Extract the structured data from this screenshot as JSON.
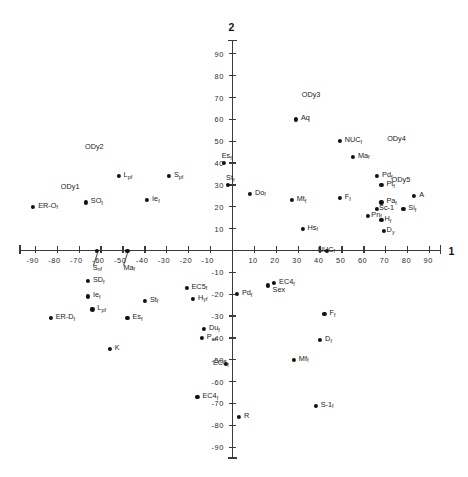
{
  "chart_data": {
    "type": "scatter",
    "title": "",
    "xlabel": "1",
    "ylabel": "2",
    "xlim": [
      -100,
      100
    ],
    "ylim": [
      -100,
      100
    ],
    "grid": false,
    "legend": null,
    "xticks": [
      -90,
      -80,
      -70,
      -60,
      -50,
      -40,
      -30,
      -20,
      -10,
      10,
      20,
      30,
      40,
      50,
      60,
      70,
      80,
      90
    ],
    "yticks": [
      -90,
      -80,
      -70,
      -60,
      -50,
      -40,
      -30,
      -20,
      -10,
      10,
      20,
      30,
      40,
      50,
      60,
      70,
      80,
      90
    ],
    "xticklabels": [
      "-90",
      "-80",
      "-70",
      "-60",
      "-50",
      "-40",
      "-30",
      "-20",
      "-10",
      "10",
      "20",
      "30",
      "40",
      "50",
      "60",
      "70",
      "80",
      "90"
    ],
    "yticklabels": [
      "-90",
      "-80",
      "-70",
      "-60",
      "-50",
      "-40",
      "-30",
      "-20",
      "-10",
      "10",
      "20",
      "30",
      "40",
      "50",
      "60",
      "70",
      "80",
      "90"
    ],
    "points": [
      {
        "label": "ODy2",
        "base": "ODy2",
        "sub": "",
        "x": -66,
        "y": 44,
        "marker": "none",
        "lx": -3,
        "ly": -9
      },
      {
        "label": "ODy1",
        "base": "ODy1",
        "sub": "",
        "x": -77,
        "y": 26,
        "marker": "none",
        "lx": -3,
        "ly": -9
      },
      {
        "label": "ODy3",
        "base": "ODy3",
        "sub": "",
        "x": 33,
        "y": 68,
        "marker": "none",
        "lx": -3,
        "ly": -9
      },
      {
        "label": "ODy4",
        "base": "ODy4",
        "sub": "",
        "x": 72,
        "y": 48,
        "marker": "none",
        "lx": -3,
        "ly": -9
      },
      {
        "label": "ODy5",
        "base": "ODy5",
        "sub": "",
        "x": 74,
        "y": 29,
        "marker": "none",
        "lx": -3,
        "ly": -9
      },
      {
        "label": "ERO",
        "base": "ER-O",
        "sub": "f",
        "x": -91,
        "y": 20,
        "marker": "dot",
        "lx": 5,
        "ly": -3
      },
      {
        "label": "SO",
        "base": "SO",
        "sub": "f",
        "x": -67,
        "y": 22,
        "marker": "dot",
        "lx": 5,
        "ly": -3
      },
      {
        "label": "Lp",
        "base": "L",
        "sub": "p f",
        "x": -52,
        "y": 34,
        "marker": "dot",
        "lx": 5,
        "ly": -3
      },
      {
        "label": "Ie",
        "base": "Ie",
        "sub": "f",
        "x": -39,
        "y": 23,
        "marker": "dot",
        "lx": 5,
        "ly": -3
      },
      {
        "label": "Sp",
        "base": "S",
        "sub": "p f",
        "x": -29,
        "y": 34,
        "marker": "dot",
        "lx": 5,
        "ly": -3
      },
      {
        "label": "Es",
        "base": "Es",
        "sub": "f",
        "x": -4,
        "y": 40,
        "marker": "dot",
        "lx": -2,
        "ly": -9
      },
      {
        "label": "St",
        "base": "St",
        "sub": "f",
        "x": -2,
        "y": 30,
        "marker": "dot",
        "lx": -2,
        "ly": -9
      },
      {
        "label": "Do",
        "base": "Do",
        "sub": "f",
        "x": 8,
        "y": 26,
        "marker": "dot",
        "lx": 5,
        "ly": -3
      },
      {
        "label": "Mt",
        "base": "Mt",
        "sub": "f",
        "x": 27,
        "y": 23,
        "marker": "dot",
        "lx": 5,
        "ly": -3
      },
      {
        "label": "Hs",
        "base": "Hs",
        "sub": "f",
        "x": 32,
        "y": 10,
        "marker": "dot",
        "lx": 5,
        "ly": -3
      },
      {
        "label": "Aq",
        "base": "Aq",
        "sub": "",
        "x": 29,
        "y": 60,
        "marker": "dot",
        "lx": 5,
        "ly": -3
      },
      {
        "label": "NUC",
        "base": "NUC",
        "sub": "f",
        "x": 49,
        "y": 50,
        "marker": "dot",
        "lx": 5,
        "ly": -3
      },
      {
        "label": "Ma",
        "base": "Ma",
        "sub": "f",
        "x": 55,
        "y": 43,
        "marker": "dot",
        "lx": 5,
        "ly": -3
      },
      {
        "label": "Pd",
        "base": "Pd",
        "sub": "f",
        "x": 66,
        "y": 34,
        "marker": "dot",
        "lx": 5,
        "ly": -3
      },
      {
        "label": "Pt",
        "base": "Pt",
        "sub": "f",
        "x": 68,
        "y": 30,
        "marker": "dot",
        "lx": 5,
        "ly": -3
      },
      {
        "label": "A",
        "base": "A",
        "sub": "",
        "x": 83,
        "y": 25,
        "marker": "dot",
        "lx": 5,
        "ly": -3
      },
      {
        "label": "F",
        "base": "F",
        "sub": "f",
        "x": 49,
        "y": 24,
        "marker": "dot",
        "lx": 5,
        "ly": -3
      },
      {
        "label": "Pa",
        "base": "Pa",
        "sub": "f",
        "x": 68,
        "y": 22,
        "marker": "dot",
        "lx": 5,
        "ly": -3
      },
      {
        "label": "Si",
        "base": "Si",
        "sub": "f",
        "x": 78,
        "y": 19,
        "marker": "dot",
        "lx": 5,
        "ly": -3
      },
      {
        "label": "Sc1",
        "base": "Sc-1",
        "sub": "",
        "x": 66,
        "y": 19,
        "marker": "dot",
        "lx": 2,
        "ly": -3
      },
      {
        "label": "Pn",
        "base": "Pn",
        "sub": "f",
        "x": 62,
        "y": 16,
        "marker": "dot",
        "lx": 3,
        "ly": -3
      },
      {
        "label": "Hf",
        "base": "H",
        "sub": "f",
        "x": 68,
        "y": 14,
        "marker": "dot",
        "lx": 3,
        "ly": -3
      },
      {
        "label": "Dy",
        "base": "D",
        "sub": "y",
        "x": 69,
        "y": 9,
        "marker": "dot",
        "lx": 3,
        "ly": -3
      },
      {
        "label": "Sn",
        "base": "S",
        "sub": "n f",
        "x": -62,
        "y": 0,
        "marker": "dot",
        "lx": -4,
        "ly": 15
      },
      {
        "label": "Ma0",
        "base": "Ma",
        "sub": "f",
        "x": -48,
        "y": 0,
        "marker": "dot",
        "lx": -4,
        "ly": 15
      },
      {
        "label": "NUC0",
        "base": "NUC",
        "sub": "f",
        "x": 43,
        "y": 0,
        "marker": "dot",
        "lx": -9,
        "ly": -3
      },
      {
        "label": "SD",
        "base": "SD",
        "sub": "f",
        "x": -66,
        "y": -14,
        "marker": "dot",
        "lx": 5,
        "ly": -3
      },
      {
        "label": "Ie2",
        "base": "Ie",
        "sub": "f",
        "x": -66,
        "y": -21,
        "marker": "dot",
        "lx": 5,
        "ly": -3
      },
      {
        "label": "Lp2",
        "base": "L",
        "sub": "p f",
        "x": -64,
        "y": -27,
        "marker": "dot",
        "lx": 5,
        "ly": -3
      },
      {
        "label": "ERD",
        "base": "ER-D",
        "sub": "f",
        "x": -83,
        "y": -31,
        "marker": "dot",
        "lx": 5,
        "ly": -3
      },
      {
        "label": "Es2",
        "base": "Es",
        "sub": "f",
        "x": -48,
        "y": -31,
        "marker": "dot",
        "lx": 5,
        "ly": -3
      },
      {
        "label": "St2",
        "base": "St",
        "sub": "f",
        "x": -40,
        "y": -23,
        "marker": "dot",
        "lx": 5,
        "ly": -3
      },
      {
        "label": "K",
        "base": "K",
        "sub": "",
        "x": -56,
        "y": -45,
        "marker": "dot",
        "lx": 5,
        "ly": -3
      },
      {
        "label": "Du",
        "base": "Du",
        "sub": "f",
        "x": -13,
        "y": -36,
        "marker": "dot",
        "lx": 5,
        "ly": -3
      },
      {
        "label": "Pa2",
        "base": "P",
        "sub": "a f",
        "x": -14,
        "y": -40,
        "marker": "dot",
        "lx": 5,
        "ly": -3
      },
      {
        "label": "EC5",
        "base": "EC5",
        "sub": "f",
        "x": -21,
        "y": -17,
        "marker": "dot",
        "lx": 5,
        "ly": -3
      },
      {
        "label": "Hy",
        "base": "H",
        "sub": "y f",
        "x": -18,
        "y": -22,
        "marker": "dot",
        "lx": 5,
        "ly": -3
      },
      {
        "label": "EC6",
        "base": "EC6",
        "sub": "f",
        "x": -3,
        "y": -52,
        "marker": "dot",
        "lx": -13,
        "ly": -3
      },
      {
        "label": "EC42",
        "base": "EC4",
        "sub": "f",
        "x": -16,
        "y": -67,
        "marker": "dot",
        "lx": 5,
        "ly": -3
      },
      {
        "label": "Pdf",
        "base": "Pd",
        "sub": "f",
        "x": 2,
        "y": -20,
        "marker": "dot",
        "lx": 5,
        "ly": -3
      },
      {
        "label": "Sex",
        "base": "Sex",
        "sub": "",
        "x": 16,
        "y": -16,
        "marker": "dot",
        "lx": 5,
        "ly": 3
      },
      {
        "label": "EC4",
        "base": "EC4",
        "sub": "f",
        "x": 19,
        "y": -15,
        "marker": "dot",
        "lx": 5,
        "ly": -3
      },
      {
        "label": "Ff",
        "base": "F",
        "sub": "f",
        "x": 42,
        "y": -29,
        "marker": "dot",
        "lx": 5,
        "ly": -3
      },
      {
        "label": "Df",
        "base": "D",
        "sub": "f",
        "x": 40,
        "y": -41,
        "marker": "dot",
        "lx": 5,
        "ly": -3
      },
      {
        "label": "Mf",
        "base": "Mf",
        "sub": "f",
        "x": 28,
        "y": -50,
        "marker": "dot",
        "lx": 5,
        "ly": -3
      },
      {
        "label": "R",
        "base": "R",
        "sub": "",
        "x": 3,
        "y": -76,
        "marker": "dot",
        "lx": 5,
        "ly": -3
      },
      {
        "label": "S1",
        "base": "S-1",
        "sub": "f",
        "x": 38,
        "y": -71,
        "marker": "dot",
        "lx": 5,
        "ly": -3
      }
    ]
  }
}
